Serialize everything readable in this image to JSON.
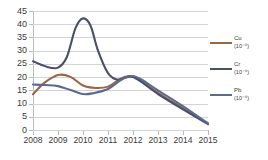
{
  "chart_data": {
    "type": "line",
    "title": "",
    "xlabel": "",
    "ylabel": "",
    "x": [
      2008,
      2009,
      2010,
      2011,
      2012,
      2013,
      2014,
      2015
    ],
    "categories": [
      "2008",
      "2009",
      "2010",
      "2011",
      "2012",
      "2013",
      "2014",
      "2015"
    ],
    "xlim": [
      2008,
      2015
    ],
    "ylim": [
      0,
      45
    ],
    "yticks": [
      0,
      5,
      10,
      15,
      20,
      25,
      30,
      35,
      40,
      45
    ],
    "ytick_labels": [
      "0",
      "5",
      "10",
      "15",
      "20",
      "25",
      "30",
      "35",
      "40",
      "45"
    ],
    "grid": "horizontal",
    "legend_position": "right",
    "series": [
      {
        "name": "Cu",
        "unit": "(10⁻⁶)",
        "color": "#9c6646",
        "values": [
          13.5,
          20.8,
          16.5,
          16.0,
          20.2,
          14.0,
          8.2,
          2.6
        ],
        "points": [
          {
            "x": 2008.0,
            "y": 13.5
          },
          {
            "x": 2008.45,
            "y": 17.8
          },
          {
            "x": 2009.0,
            "y": 20.8
          },
          {
            "x": 2009.5,
            "y": 20.1
          },
          {
            "x": 2010.0,
            "y": 16.8
          },
          {
            "x": 2010.5,
            "y": 15.9
          },
          {
            "x": 2011.0,
            "y": 16.4
          },
          {
            "x": 2011.5,
            "y": 19.4
          },
          {
            "x": 2011.85,
            "y": 20.4
          },
          {
            "x": 2012.2,
            "y": 19.6
          },
          {
            "x": 2013.0,
            "y": 14.0
          },
          {
            "x": 2014.0,
            "y": 8.2
          },
          {
            "x": 2015.0,
            "y": 2.6
          }
        ]
      },
      {
        "name": "Cr",
        "unit": "(10⁻⁶)",
        "color": "#4a4f6b",
        "values": [
          26.0,
          23.6,
          42.2,
          21.5,
          20.0,
          13.6,
          7.8,
          2.2
        ],
        "points": [
          {
            "x": 2008.0,
            "y": 26.0
          },
          {
            "x": 2008.55,
            "y": 23.9
          },
          {
            "x": 2009.0,
            "y": 23.6
          },
          {
            "x": 2009.35,
            "y": 27.5
          },
          {
            "x": 2009.7,
            "y": 38.5
          },
          {
            "x": 2010.0,
            "y": 42.2
          },
          {
            "x": 2010.3,
            "y": 39.5
          },
          {
            "x": 2010.6,
            "y": 30.0
          },
          {
            "x": 2011.0,
            "y": 21.5
          },
          {
            "x": 2011.4,
            "y": 19.0
          },
          {
            "x": 2012.0,
            "y": 20.0
          },
          {
            "x": 2013.0,
            "y": 13.6
          },
          {
            "x": 2014.0,
            "y": 7.8
          },
          {
            "x": 2015.0,
            "y": 2.2
          }
        ]
      },
      {
        "name": "Pb",
        "unit": "(10⁻⁶)",
        "color": "#5b6a8f",
        "values": [
          17.2,
          16.6,
          13.6,
          15.5,
          20.4,
          15.0,
          9.0,
          2.4
        ],
        "points": [
          {
            "x": 2008.0,
            "y": 17.2
          },
          {
            "x": 2008.5,
            "y": 17.0
          },
          {
            "x": 2009.0,
            "y": 16.6
          },
          {
            "x": 2009.5,
            "y": 15.1
          },
          {
            "x": 2010.0,
            "y": 13.6
          },
          {
            "x": 2010.4,
            "y": 13.9
          },
          {
            "x": 2011.0,
            "y": 15.5
          },
          {
            "x": 2011.5,
            "y": 18.8
          },
          {
            "x": 2011.9,
            "y": 20.4
          },
          {
            "x": 2012.3,
            "y": 19.3
          },
          {
            "x": 2013.0,
            "y": 15.0
          },
          {
            "x": 2014.0,
            "y": 9.0
          },
          {
            "x": 2015.0,
            "y": 2.4
          }
        ]
      }
    ]
  },
  "axis": {
    "y_ticks": [
      "45",
      "40",
      "35",
      "30",
      "25",
      "20",
      "15",
      "10",
      "5",
      "0"
    ],
    "x_ticks": [
      "2008",
      "2009",
      "2010",
      "2011",
      "2012",
      "2013",
      "2014",
      "2015"
    ]
  },
  "legend": {
    "items": [
      {
        "label": "Cu",
        "unit": "(10⁻⁶)",
        "color": "#9c6646"
      },
      {
        "label": "Cr",
        "unit": "(10⁻⁶)",
        "color": "#4a4f6b"
      },
      {
        "label": "Pb",
        "unit": "(10⁻⁶)",
        "color": "#5b6a8f"
      }
    ]
  }
}
